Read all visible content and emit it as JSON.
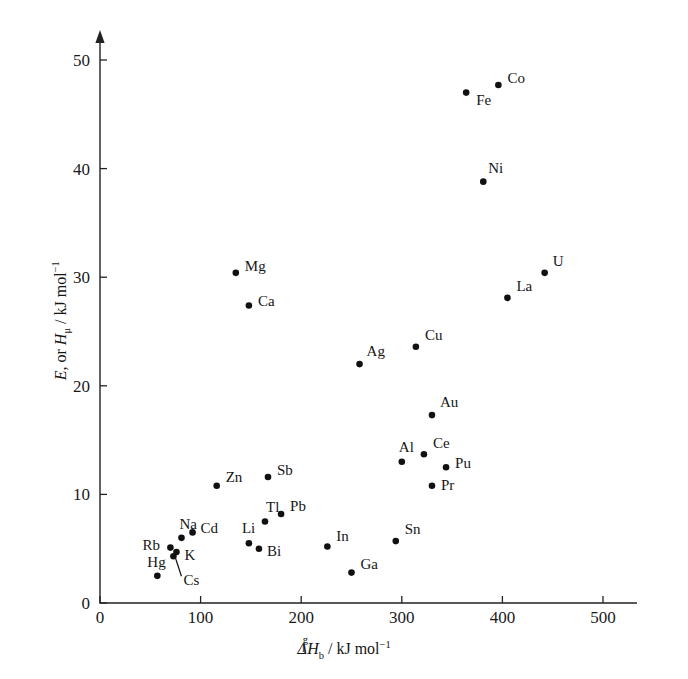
{
  "figure": {
    "background": "#ffffff",
    "point_color": "#111111",
    "axis_color": "#222222"
  },
  "chart_data": {
    "type": "scatter",
    "title": "",
    "xlabel": "Δ(l,g) H_b / kJ mol^-1",
    "ylabel": "E, or H_μ / kJ mol^-1",
    "xlim": [
      0,
      520
    ],
    "ylim": [
      0,
      52
    ],
    "xticks": [
      0,
      100,
      200,
      300,
      400,
      500
    ],
    "yticks": [
      0,
      10,
      20,
      30,
      40,
      50
    ],
    "xtick_labels": [
      "0",
      "100",
      "200",
      "300",
      "400",
      "500"
    ],
    "ytick_labels": [
      "0",
      "10",
      "20",
      "30",
      "40",
      "50"
    ],
    "grid": false,
    "legend": null,
    "points": [
      {
        "label": "Fe",
        "x": 364,
        "y": 47.0,
        "lx": 10,
        "ly": 12
      },
      {
        "label": "Co",
        "x": 396,
        "y": 47.7,
        "lx": 9,
        "ly": -2
      },
      {
        "label": "Ni",
        "x": 381,
        "y": 38.8,
        "lx": 5,
        "ly": -9
      },
      {
        "label": "U",
        "x": 442,
        "y": 30.4,
        "lx": 8,
        "ly": -7
      },
      {
        "label": "La",
        "x": 405,
        "y": 28.1,
        "lx": 9,
        "ly": -7
      },
      {
        "label": "Mg",
        "x": 135,
        "y": 30.4,
        "lx": 9,
        "ly": -2
      },
      {
        "label": "Ca",
        "x": 148,
        "y": 27.4,
        "lx": 9,
        "ly": 1
      },
      {
        "label": "Cu",
        "x": 314,
        "y": 23.6,
        "lx": 9,
        "ly": -7
      },
      {
        "label": "Ag",
        "x": 258,
        "y": 22.0,
        "lx": 7,
        "ly": -8
      },
      {
        "label": "Au",
        "x": 330,
        "y": 17.3,
        "lx": 8,
        "ly": -8
      },
      {
        "label": "Ce",
        "x": 322,
        "y": 13.7,
        "lx": 9,
        "ly": -6
      },
      {
        "label": "Al",
        "x": 300,
        "y": 13.0,
        "lx": -3,
        "ly": -10
      },
      {
        "label": "Pu",
        "x": 344,
        "y": 12.5,
        "lx": 9,
        "ly": 1
      },
      {
        "label": "Pr",
        "x": 330,
        "y": 10.8,
        "lx": 9,
        "ly": 4
      },
      {
        "label": "Sb",
        "x": 167,
        "y": 11.6,
        "lx": 9,
        "ly": -2
      },
      {
        "label": "Zn",
        "x": 116,
        "y": 10.8,
        "lx": 9,
        "ly": -4
      },
      {
        "label": "Pb",
        "x": 180,
        "y": 8.2,
        "lx": 9,
        "ly": -3
      },
      {
        "label": "Tl",
        "x": 164,
        "y": 7.5,
        "lx": 1,
        "ly": -10
      },
      {
        "label": "Cd",
        "x": 92,
        "y": 6.5,
        "lx": 8,
        "ly": 1
      },
      {
        "label": "Na",
        "x": 81,
        "y": 6.0,
        "lx": -2,
        "ly": -9
      },
      {
        "label": "Li",
        "x": 148,
        "y": 5.5,
        "lx": -7,
        "ly": -10
      },
      {
        "label": "Bi",
        "x": 158,
        "y": 5.0,
        "lx": 8,
        "ly": 7
      },
      {
        "label": "In",
        "x": 226,
        "y": 5.2,
        "lx": 9,
        "ly": -6
      },
      {
        "label": "Sn",
        "x": 294,
        "y": 5.7,
        "lx": 9,
        "ly": -7
      },
      {
        "label": "Ga",
        "x": 250,
        "y": 2.8,
        "lx": 9,
        "ly": -4
      },
      {
        "label": "Rb",
        "x": 70,
        "y": 5.1,
        "lx": -28,
        "ly": 2
      },
      {
        "label": "K",
        "x": 76,
        "y": 4.7,
        "lx": 8,
        "ly": 8
      },
      {
        "label": "Hg",
        "x": 57,
        "y": 2.5,
        "lx": -10,
        "ly": -9
      },
      {
        "label": "Cs",
        "x": 73,
        "y": 4.3,
        "lx": 10,
        "ly": 29,
        "leader": true
      }
    ]
  }
}
